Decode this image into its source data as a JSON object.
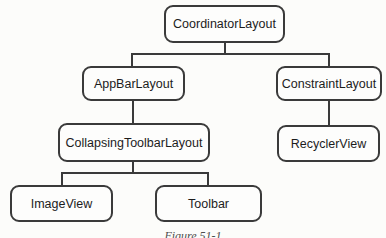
{
  "diagram": {
    "type": "tree",
    "caption": "Figure 51-1",
    "colors": {
      "background": "#fcfcfa",
      "node_fill": "#fdfdfc",
      "node_border": "#3a3a3a",
      "connector": "#3a3a3a",
      "text": "#1c1c1c"
    },
    "nodes": [
      {
        "id": "coordinator-layout",
        "label": "CoordinatorLayout"
      },
      {
        "id": "app-bar-layout",
        "label": "AppBarLayout"
      },
      {
        "id": "constraint-layout",
        "label": "ConstraintLayout"
      },
      {
        "id": "collapsing-toolbar-layout",
        "label": "CollapsingToolbarLayout"
      },
      {
        "id": "recycler-view",
        "label": "RecyclerView"
      },
      {
        "id": "image-view",
        "label": "ImageView"
      },
      {
        "id": "toolbar",
        "label": "Toolbar"
      }
    ],
    "edges": [
      {
        "parent": "coordinator-layout",
        "child": "app-bar-layout"
      },
      {
        "parent": "coordinator-layout",
        "child": "constraint-layout"
      },
      {
        "parent": "app-bar-layout",
        "child": "collapsing-toolbar-layout"
      },
      {
        "parent": "constraint-layout",
        "child": "recycler-view"
      },
      {
        "parent": "collapsing-toolbar-layout",
        "child": "image-view"
      },
      {
        "parent": "collapsing-toolbar-layout",
        "child": "toolbar"
      }
    ]
  }
}
